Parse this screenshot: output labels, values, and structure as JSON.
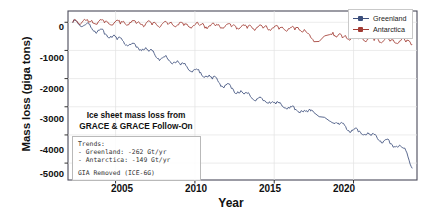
{
  "chart_data": {
    "type": "line",
    "title": "",
    "xlabel": "Year",
    "ylabel": "Mass loss (giga tons)",
    "xlim": [
      2002,
      2024
    ],
    "ylim": [
      -5600,
      400
    ],
    "xticks": [
      2005,
      2010,
      2015,
      2020
    ],
    "yticks": [
      0,
      -1000,
      -2000,
      -3000,
      -4000,
      -5000
    ],
    "ytick_labels": [
      "0",
      "-1000",
      "-2000",
      "-3000",
      "-4000",
      "-5000"
    ],
    "xtick_labels": [
      "2005",
      "2010",
      "2015",
      "2020"
    ],
    "grid": true,
    "legend_position": "upper right",
    "data_gap": [
      2017.6,
      2018.5
    ],
    "series": [
      {
        "name": "Greenland",
        "color": "#3d4f7c",
        "trend_gt_per_yr": -262,
        "x": [
          2002.3,
          2002.5,
          2002.7,
          2002.9,
          2003.1,
          2003.3,
          2003.5,
          2003.7,
          2003.9,
          2004.1,
          2004.3,
          2004.5,
          2004.7,
          2004.9,
          2005.1,
          2005.3,
          2005.5,
          2005.7,
          2005.9,
          2006.1,
          2006.3,
          2006.5,
          2006.7,
          2006.9,
          2007.1,
          2007.3,
          2007.5,
          2007.7,
          2007.9,
          2008.1,
          2008.3,
          2008.5,
          2008.7,
          2008.9,
          2009.1,
          2009.3,
          2009.5,
          2009.7,
          2009.9,
          2010.1,
          2010.3,
          2010.5,
          2010.7,
          2010.9,
          2011.1,
          2011.3,
          2011.5,
          2011.7,
          2011.9,
          2012.1,
          2012.3,
          2012.5,
          2012.7,
          2012.9,
          2013.1,
          2013.3,
          2013.5,
          2013.7,
          2013.9,
          2014.1,
          2014.3,
          2014.5,
          2014.7,
          2014.9,
          2015.1,
          2015.3,
          2015.5,
          2015.7,
          2015.9,
          2016.1,
          2016.3,
          2016.5,
          2016.7,
          2016.9,
          2017.1,
          2017.3,
          2017.5,
          2018.5,
          2018.7,
          2018.9,
          2019.1,
          2019.3,
          2019.5,
          2019.7,
          2019.9,
          2020.1,
          2020.3,
          2020.5,
          2020.7,
          2020.9,
          2021.1,
          2021.3,
          2021.5,
          2021.7,
          2021.9,
          2022.1,
          2022.3,
          2022.5,
          2022.7,
          2022.9,
          2023.1,
          2023.3,
          2023.5,
          2023.7
        ],
        "y": [
          0,
          80,
          -60,
          -150,
          -100,
          -60,
          -230,
          -330,
          -300,
          -250,
          -420,
          -520,
          -490,
          -450,
          -600,
          -560,
          -700,
          -800,
          -780,
          -740,
          -880,
          -980,
          -960,
          -900,
          -1050,
          -1000,
          -1180,
          -1300,
          -1260,
          -1210,
          -1330,
          -1450,
          -1420,
          -1380,
          -1500,
          -1460,
          -1590,
          -1720,
          -1700,
          -1660,
          -1800,
          -1930,
          -1910,
          -1860,
          -2000,
          -1960,
          -2120,
          -2270,
          -2250,
          -2200,
          -2340,
          -2500,
          -2480,
          -2430,
          -2560,
          -2520,
          -2640,
          -2740,
          -2720,
          -2680,
          -2780,
          -2850,
          -2830,
          -2800,
          -2890,
          -2860,
          -2960,
          -3050,
          -3030,
          -3000,
          -3090,
          -3160,
          -3140,
          -3110,
          -3180,
          -3150,
          -3200,
          -3500,
          -3560,
          -3540,
          -3620,
          -3590,
          -3720,
          -3840,
          -3820,
          -3780,
          -3890,
          -3980,
          -3960,
          -3920,
          -4030,
          -4000,
          -4120,
          -4230,
          -4210,
          -4170,
          -4300,
          -4420,
          -4400,
          -4360,
          -4480,
          -4560,
          -4900,
          -5200
        ]
      },
      {
        "name": "Antarctica",
        "color": "#a23b33",
        "trend_gt_per_yr": -149,
        "x": [
          2002.3,
          2002.5,
          2002.7,
          2002.9,
          2003.1,
          2003.3,
          2003.5,
          2003.7,
          2003.9,
          2004.1,
          2004.3,
          2004.5,
          2004.7,
          2004.9,
          2005.1,
          2005.3,
          2005.5,
          2005.7,
          2005.9,
          2006.1,
          2006.3,
          2006.5,
          2006.7,
          2006.9,
          2007.1,
          2007.3,
          2007.5,
          2007.7,
          2007.9,
          2008.1,
          2008.3,
          2008.5,
          2008.7,
          2008.9,
          2009.1,
          2009.3,
          2009.5,
          2009.7,
          2009.9,
          2010.1,
          2010.3,
          2010.5,
          2010.7,
          2010.9,
          2011.1,
          2011.3,
          2011.5,
          2011.7,
          2011.9,
          2012.1,
          2012.3,
          2012.5,
          2012.7,
          2012.9,
          2013.1,
          2013.3,
          2013.5,
          2013.7,
          2013.9,
          2014.1,
          2014.3,
          2014.5,
          2014.7,
          2014.9,
          2015.1,
          2015.3,
          2015.5,
          2015.7,
          2015.9,
          2016.1,
          2016.3,
          2016.5,
          2016.7,
          2016.9,
          2017.1,
          2017.3,
          2017.5,
          2018.5,
          2018.7,
          2018.9,
          2019.1,
          2019.3,
          2019.5,
          2019.7,
          2019.9,
          2020.1,
          2020.3,
          2020.5,
          2020.7,
          2020.9,
          2021.1,
          2021.3,
          2021.5,
          2021.7,
          2021.9,
          2022.1,
          2022.3,
          2022.5,
          2022.7,
          2022.9,
          2023.1,
          2023.3,
          2023.5,
          2023.7
        ],
        "y": [
          0,
          90,
          -40,
          40,
          90,
          -20,
          60,
          -60,
          20,
          80,
          -30,
          30,
          -80,
          -10,
          60,
          -40,
          20,
          -90,
          -20,
          40,
          -60,
          10,
          -110,
          -40,
          30,
          -70,
          0,
          -130,
          -60,
          10,
          -90,
          -20,
          -150,
          -80,
          -10,
          -110,
          -40,
          -170,
          -100,
          -30,
          -130,
          -60,
          -190,
          -120,
          -50,
          -150,
          -80,
          -210,
          -140,
          -70,
          -170,
          -100,
          -230,
          -160,
          -90,
          -190,
          -120,
          -250,
          -180,
          -110,
          -210,
          -140,
          -270,
          -200,
          -130,
          -230,
          -160,
          -290,
          -220,
          -150,
          -250,
          -180,
          -310,
          -240,
          -400,
          -560,
          -700,
          -450,
          -380,
          -500,
          -430,
          -560,
          -490,
          -620,
          -550,
          -470,
          -600,
          -530,
          -660,
          -590,
          -510,
          -640,
          -570,
          -700,
          -630,
          -550,
          -680,
          -610,
          -740,
          -670,
          -590,
          -720,
          -650,
          -780
        ]
      }
    ],
    "annotation_title": "Ice sheet mass loss from\nGRACE & GRACE Follow-On",
    "annotation_box": {
      "line1": "Trends:",
      "line2": "- Greenland:  -262 Gt/yr",
      "line3": "- Antarctica: -149 Gt/yr",
      "line4": "GIA Removed (ICE-6G)"
    }
  },
  "legend": {
    "items": [
      {
        "label": "Greenland",
        "color": "#3d4f7c"
      },
      {
        "label": "Antarctica",
        "color": "#a23b33"
      }
    ]
  },
  "annotation": {
    "title_line1": "Ice sheet mass loss from",
    "title_line2": "GRACE & GRACE Follow-On",
    "trends_header": "Trends:",
    "trend_greenland": "- Greenland:  -262 Gt/yr",
    "trend_antarctica": "- Antarctica: -149 Gt/yr",
    "gia_note": "GIA Removed (ICE-6G)"
  },
  "axes": {
    "ylabel": "Mass loss (giga tons)",
    "xlabel": "Year",
    "yticks": [
      "0",
      "-1000",
      "-2000",
      "-3000",
      "-4000",
      "-5000"
    ],
    "xticks": [
      "2005",
      "2010",
      "2015",
      "2020"
    ]
  }
}
